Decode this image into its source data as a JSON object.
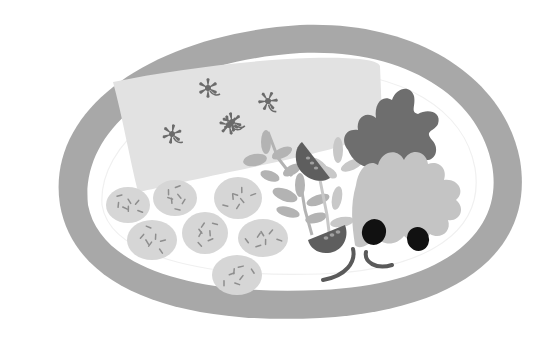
{
  "illustration": {
    "title": "Plate with fish fillet, potatoes, herbs, tomato, lettuce and olives",
    "style": "flat grayscale vector",
    "items": [
      {
        "name": "plate-rim",
        "label": "Plate rim"
      },
      {
        "name": "fish-fillet",
        "label": "Fish fillet"
      },
      {
        "name": "herb-garnish",
        "label": "Star-shaped herb garnish",
        "count": 5
      },
      {
        "name": "potatoes",
        "label": "Potatoes",
        "count": 7
      },
      {
        "name": "herb-sprigs",
        "label": "Herb sprigs"
      },
      {
        "name": "tomato-slices",
        "label": "Tomato wedges",
        "count": 2
      },
      {
        "name": "dark-lettuce",
        "label": "Dark lettuce leaf"
      },
      {
        "name": "light-lettuce",
        "label": "Light lettuce leaf"
      },
      {
        "name": "olives",
        "label": "Black olives",
        "count": 2
      },
      {
        "name": "onion-rings",
        "label": "Onion ring slices",
        "count": 2
      }
    ],
    "colors": {
      "background": "#ffffff",
      "rim": "#a8a8a8",
      "plate": "#ffffff",
      "plate_inner_line": "#f0f0f0",
      "fillet": "#e2e2e2",
      "garnish": "#6b6b6b",
      "potato": "#d6d6d6",
      "potato_fleck": "#8e8e8e",
      "herb": "#b3b3b3",
      "herb_light": "#c8c8c8",
      "tomato": "#5e5e5e",
      "tomato_seed": "#a0a0a0",
      "lettuce_dark": "#6e6e6e",
      "lettuce_light": "#c4c4c4",
      "olive": "#111111",
      "onion": "#5a5a5a"
    }
  }
}
